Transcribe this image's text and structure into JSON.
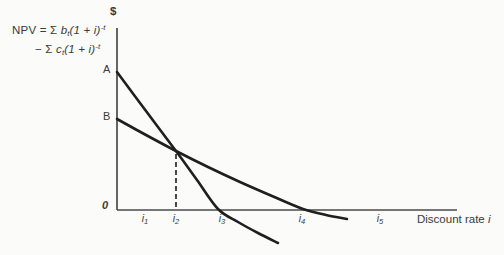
{
  "formula": {
    "line1": {
      "prefix": "NPV = Σ ",
      "var": "b",
      "sub": "t",
      "body": "(1 + i)",
      "sup": "-t"
    },
    "line2": {
      "prefix": "− Σ ",
      "var": "c",
      "sub": "t",
      "body": "(1 + i)",
      "sup": "-t"
    }
  },
  "axes": {
    "y_label": "$",
    "origin_label": "0",
    "x_label_text": "Discount rate",
    "x_label_var": "i"
  },
  "curves": {
    "a_label": "A",
    "b_label": "B"
  },
  "ticks": [
    {
      "base": "i",
      "sub": "1"
    },
    {
      "base": "i",
      "sub": "2"
    },
    {
      "base": "i",
      "sub": "3"
    },
    {
      "base": "i",
      "sub": "4"
    },
    {
      "base": "i",
      "sub": "5"
    }
  ],
  "chart_data": {
    "type": "line",
    "title": "",
    "xlabel": "Discount rate i",
    "ylabel": "$",
    "grid": false,
    "legend": "none",
    "x_ticks": [
      "i1",
      "i2",
      "i3",
      "i4",
      "i5"
    ],
    "x_tick_px": [
      145,
      176,
      222,
      302,
      380
    ],
    "axis_px": {
      "origin": [
        117,
        210
      ],
      "x_end": 457,
      "y_top": 28
    },
    "series": [
      {
        "name": "A",
        "y_axis_intercept_label": "A",
        "crosses_x_axis_at": "i3",
        "points_px": [
          [
            117,
            72
          ],
          [
            146,
            111
          ],
          [
            176,
            151
          ],
          [
            197,
            180
          ],
          [
            218,
            209
          ],
          [
            238,
            222
          ],
          [
            258,
            233
          ],
          [
            278,
            243
          ]
        ]
      },
      {
        "name": "B",
        "y_axis_intercept_label": "B",
        "crosses_x_axis_at": "i4",
        "points_px": [
          [
            117,
            119
          ],
          [
            146,
            135
          ],
          [
            176,
            151
          ],
          [
            208,
            167
          ],
          [
            240,
            182
          ],
          [
            272,
            196
          ],
          [
            303,
            209
          ],
          [
            326,
            215
          ],
          [
            347,
            219
          ]
        ]
      }
    ],
    "intersection_px": [
      176,
      151
    ],
    "drop_line": {
      "x": 176,
      "y1": 154,
      "y2": 209,
      "at_tick": "i2",
      "style": "dashed"
    },
    "colors": {
      "curve": "#1f1f1f",
      "axis": "#4a4a4a",
      "drop": "#2a2a2a",
      "text": "#3a3a3a"
    }
  }
}
